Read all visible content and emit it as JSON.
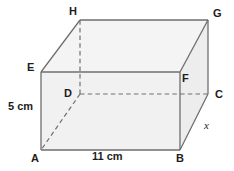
{
  "diagram": {
    "type": "cuboid-net-3d",
    "colors": {
      "edge_solid": "#6e6e6e",
      "edge_hidden": "#6e6e6e",
      "face_front": "#f1f1f1",
      "face_top": "#f4f4f4",
      "face_right": "#ededed",
      "text": "#1d1d1d",
      "background": "#ffffff"
    },
    "vertices": [
      {
        "name": "A",
        "label": "A",
        "x": 41,
        "y": 150,
        "label_x": 31,
        "label_y": 153,
        "hidden": false
      },
      {
        "name": "B",
        "label": "B",
        "x": 180,
        "y": 150,
        "label_x": 176,
        "label_y": 153,
        "hidden": false
      },
      {
        "name": "C",
        "label": "C",
        "x": 208,
        "y": 94,
        "label_x": 215,
        "label_y": 89,
        "hidden": false
      },
      {
        "name": "D",
        "label": "D",
        "x": 80,
        "y": 94,
        "label_x": 64,
        "label_y": 88,
        "hidden": true
      },
      {
        "name": "E",
        "label": "E",
        "x": 41,
        "y": 72,
        "label_x": 27,
        "label_y": 62,
        "hidden": false
      },
      {
        "name": "F",
        "label": "F",
        "x": 180,
        "y": 72,
        "label_x": 182,
        "label_y": 73,
        "hidden": false
      },
      {
        "name": "G",
        "label": "G",
        "x": 208,
        "y": 20,
        "label_x": 213,
        "label_y": 8,
        "hidden": false
      },
      {
        "name": "H",
        "label": "H",
        "x": 80,
        "y": 20,
        "label_x": 69,
        "label_y": 6,
        "hidden": false
      }
    ],
    "measurements": [
      {
        "name": "height",
        "text": "5 cm",
        "x": 8,
        "y": 101,
        "style": "upright"
      },
      {
        "name": "width",
        "text": "11 cm",
        "x": 92,
        "y": 151,
        "style": "upright"
      },
      {
        "name": "depth",
        "text": "x",
        "x": 204,
        "y": 120,
        "style": "italic"
      }
    ]
  }
}
